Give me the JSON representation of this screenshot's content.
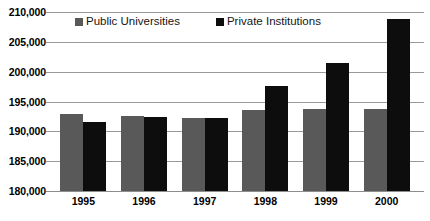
{
  "chart_data": {
    "type": "bar",
    "title": "",
    "xlabel": "",
    "ylabel": "",
    "categories": [
      "1995",
      "1996",
      "1997",
      "1998",
      "1999",
      "2000"
    ],
    "series": [
      {
        "name": "Public Universities",
        "color": "#595959",
        "values": [
          192900,
          192500,
          192200,
          193500,
          193800,
          193700
        ]
      },
      {
        "name": "Private Institutions",
        "color": "#0d0d0d",
        "values": [
          191500,
          192400,
          192300,
          197600,
          201500,
          208900
        ]
      }
    ],
    "ylim": [
      180000,
      210000
    ],
    "ytick_step": 5000,
    "ytick_labels": [
      "210,000",
      "205,000",
      "200,000",
      "195,000",
      "190,000",
      "185,000",
      "180,000"
    ],
    "ytick_values": [
      210000,
      205000,
      200000,
      195000,
      190000,
      185000,
      180000
    ],
    "grid": true,
    "legend_position": "top-center",
    "legend": [
      {
        "label": "Public Universities",
        "swatch": "public"
      },
      {
        "label": "Private Institutions",
        "swatch": "private"
      }
    ]
  }
}
